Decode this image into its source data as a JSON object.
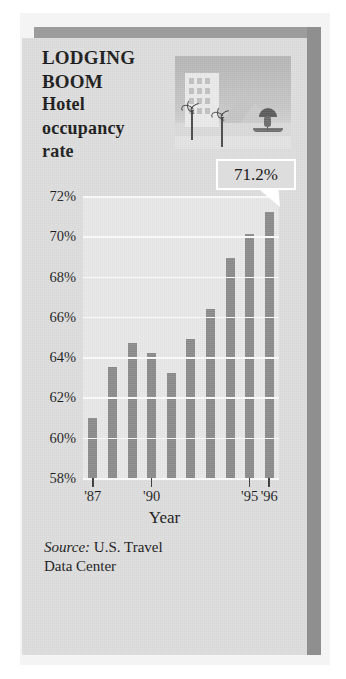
{
  "card": {
    "headline_line1": "LODGING",
    "headline_line2": "BOOM",
    "subtitle_line1": "Hotel",
    "subtitle_line2": "occupancy",
    "subtitle_line3": "rate"
  },
  "artwork": {
    "name": "beach-resort-illustration",
    "elements": [
      "hotel-building",
      "palm-tree",
      "mountain",
      "beach-umbrella",
      "sand"
    ]
  },
  "callout": {
    "value_label": "71.2%"
  },
  "source": {
    "prefix": "Source:",
    "text": " U.S. Travel",
    "line2": "Data Center"
  },
  "colors": {
    "card_background": "#dcdcdc",
    "plot_background": "#e7e7e7",
    "bar": "#8a8a8a",
    "gridline": "#fafafa",
    "shadow": "#9c9c9c",
    "text": "#1a1a1a"
  },
  "chart_data": {
    "type": "bar",
    "title": "LODGING BOOM Hotel occupancy rate",
    "xlabel": "Year",
    "ylabel": "",
    "ylim": [
      58,
      72
    ],
    "yticks": [
      58,
      60,
      62,
      64,
      66,
      68,
      70,
      72
    ],
    "ytick_labels": [
      "58%",
      "60%",
      "62%",
      "64%",
      "66%",
      "68%",
      "70%",
      "72%"
    ],
    "grid": true,
    "legend": false,
    "categories": [
      "1987",
      "1988",
      "1989",
      "1990",
      "1991",
      "1992",
      "1993",
      "1994",
      "1995",
      "1996"
    ],
    "xtick_positions": [
      "1987",
      "1990",
      "1995",
      "1996"
    ],
    "xtick_labels": [
      "'87",
      "'90",
      "'95",
      "'96"
    ],
    "values": [
      61.0,
      63.5,
      64.7,
      64.2,
      63.2,
      64.9,
      66.4,
      68.9,
      70.1,
      71.2
    ],
    "annotations": [
      {
        "label": "71.2%",
        "points_to_category": "1996",
        "value": 71.2
      }
    ],
    "source": "Source: U.S. Travel Data Center"
  }
}
